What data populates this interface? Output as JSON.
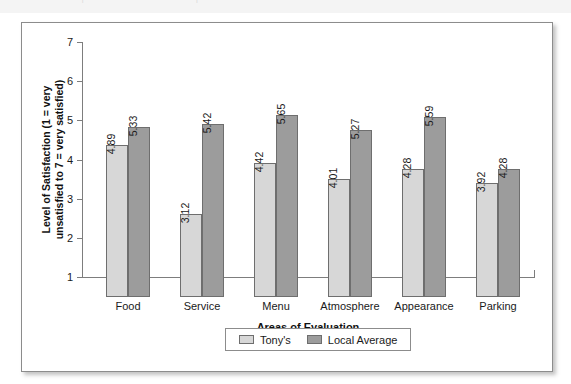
{
  "page": {
    "top_strip_ghost_text": "· | · |"
  },
  "chart_data": {
    "type": "bar",
    "title": "",
    "xlabel": "Areas of Evaluation",
    "ylabel": "Level of Satisfaction (1 = very unsatisfied to 7 = very satisfied)",
    "ylabel_lines": [
      "Level of Satisfaction (1 = very",
      "unsatisfied to 7 = very satisfied)"
    ],
    "categories": [
      "Food",
      "Service",
      "Menu",
      "Atmosphere",
      "Appearance",
      "Parking"
    ],
    "series": [
      {
        "name": "Tony's",
        "color": "#d7d7d7",
        "values": [
          4.89,
          3.12,
          4.42,
          4.01,
          4.28,
          3.92
        ],
        "labels": [
          "4.89",
          "3.12",
          "4.42",
          "4.01",
          "4.28",
          "3.92"
        ]
      },
      {
        "name": "Local Average",
        "color": "#9c9c9c",
        "values": [
          5.33,
          5.42,
          5.65,
          5.27,
          5.59,
          4.28
        ],
        "labels": [
          "5.33",
          "5.42",
          "5.65",
          "5.27",
          "5.59",
          "4.28"
        ]
      }
    ],
    "ylim": [
      1,
      7
    ],
    "yticks": [
      1,
      2,
      3,
      4,
      5,
      6,
      7
    ],
    "ytick_labels": [
      "1",
      "2",
      "3",
      "4",
      "5",
      "6",
      "7"
    ],
    "grid": false,
    "legend_position": "bottom-center",
    "data_labels_rotated": true
  }
}
